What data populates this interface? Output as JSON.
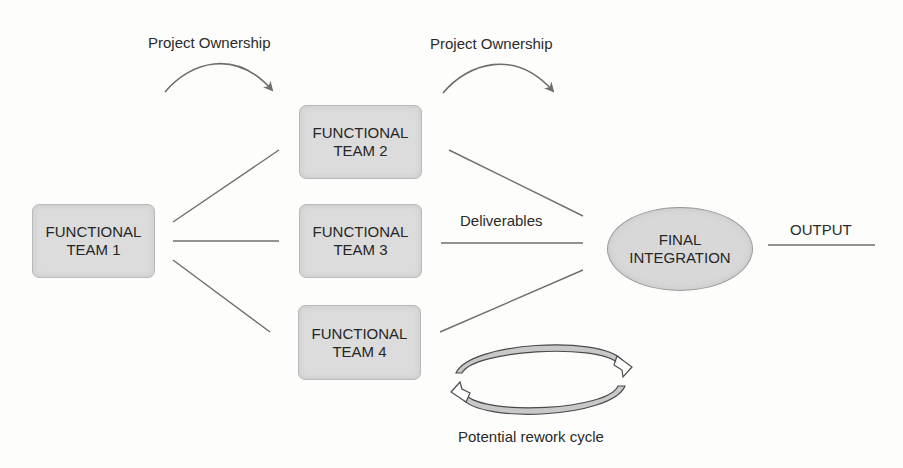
{
  "diagram": {
    "annotations": {
      "ownership_1": "Project Ownership",
      "ownership_2": "Project Ownership",
      "deliverables": "Deliverables",
      "output": "OUTPUT",
      "rework": "Potential rework cycle"
    },
    "nodes": [
      {
        "id": "team1",
        "line1": "FUNCTIONAL",
        "line2": "TEAM 1"
      },
      {
        "id": "team2",
        "line1": "FUNCTIONAL",
        "line2": "TEAM 2"
      },
      {
        "id": "team3",
        "line1": "FUNCTIONAL",
        "line2": "TEAM 3"
      },
      {
        "id": "team4",
        "line1": "FUNCTIONAL",
        "line2": "TEAM 4"
      },
      {
        "id": "final",
        "line1": "FINAL",
        "line2": "INTEGRATION"
      }
    ],
    "edges": [
      {
        "from": "team1",
        "to": "team2"
      },
      {
        "from": "team1",
        "to": "team3"
      },
      {
        "from": "team1",
        "to": "team4"
      },
      {
        "from": "team2",
        "to": "final"
      },
      {
        "from": "team3",
        "to": "final"
      },
      {
        "from": "team4",
        "to": "final"
      },
      {
        "from": "final",
        "to": "output"
      }
    ],
    "colors": {
      "node_fill": "#dcdcdc",
      "line": "#6e6e6e",
      "background": "#fdfdfb"
    }
  }
}
